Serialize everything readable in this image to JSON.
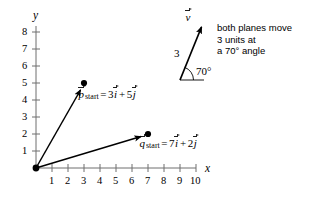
{
  "figure": {
    "background": "#ffffff",
    "ink": "#000000",
    "axis_color": "#6f6f6f"
  },
  "axes": {
    "x_label": "x",
    "y_label": "y",
    "x_ticks": [
      "1",
      "2",
      "3",
      "4",
      "5",
      "6",
      "7",
      "8",
      "9",
      "10"
    ],
    "y_ticks": [
      "1",
      "2",
      "3",
      "4",
      "5",
      "6",
      "7",
      "8"
    ],
    "x_range": [
      0,
      10
    ],
    "y_range": [
      0,
      8
    ]
  },
  "vectors": [
    {
      "name": "p",
      "symbol": "p",
      "subscript": "start",
      "i_coefficient": "3",
      "j_coefficient": "5",
      "i_unit": "i",
      "j_unit": "j",
      "operator": "+",
      "equals": "=",
      "tip_x": 3,
      "tip_y": 5,
      "origin_x": 0,
      "origin_y": 0
    },
    {
      "name": "q",
      "symbol": "q",
      "subscript": "start",
      "i_coefficient": "7",
      "j_coefficient": "2",
      "i_unit": "i",
      "j_unit": "j",
      "operator": "+",
      "equals": "=",
      "tip_x": 7,
      "tip_y": 2,
      "origin_x": 0,
      "origin_y": 0
    }
  ],
  "velocity_inset": {
    "vector_label": "v",
    "magnitude_label": "3",
    "angle_label": "70°",
    "angle_degrees": 70
  },
  "annotation": {
    "line1": "both planes move",
    "line2": "3 units at",
    "line3": "a 70° angle"
  }
}
